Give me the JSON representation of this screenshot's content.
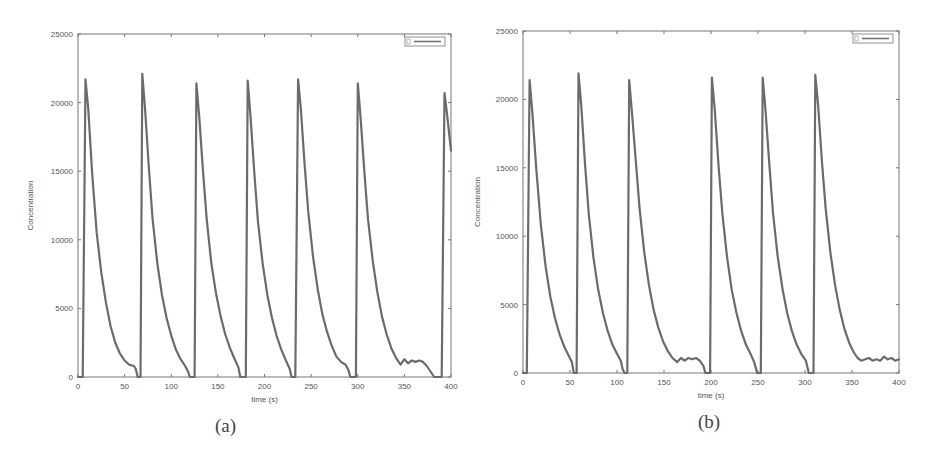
{
  "figure": {
    "panels": [
      {
        "caption": "(a)"
      },
      {
        "caption": "(b)"
      }
    ]
  },
  "chart_data": [
    {
      "type": "line",
      "title": "",
      "caption": "(a)",
      "xlabel": "time (s)",
      "ylabel": "Concentration",
      "xlim": [
        0,
        400
      ],
      "ylim": [
        0,
        25000
      ],
      "xticks": [
        0,
        50,
        100,
        150,
        200,
        250,
        300,
        350,
        400
      ],
      "yticks": [
        0,
        5000,
        10000,
        15000,
        20000,
        25000
      ],
      "grid": false,
      "legend": {
        "position": "upper right",
        "entries": [
          ""
        ]
      },
      "line_color": "#6b6b6b",
      "series": [
        {
          "name": "",
          "x": [
            0,
            5,
            8,
            11,
            15,
            20,
            25,
            30,
            35,
            40,
            45,
            50,
            55,
            60,
            62,
            64,
            65,
            67,
            69,
            72,
            76,
            80,
            85,
            90,
            95,
            100,
            105,
            110,
            115,
            118,
            120,
            121,
            122,
            124,
            125,
            127,
            130,
            134,
            138,
            143,
            148,
            153,
            158,
            163,
            168,
            172,
            174,
            175,
            177,
            179,
            180,
            182,
            185,
            189,
            193,
            198,
            203,
            208,
            213,
            218,
            223,
            227,
            229,
            230,
            232,
            233,
            236,
            239,
            243,
            247,
            252,
            257,
            262,
            267,
            272,
            277,
            282,
            287,
            290,
            292,
            293,
            296,
            298,
            300,
            303,
            307,
            311,
            316,
            321,
            326,
            331,
            336,
            341,
            346,
            350,
            354,
            358,
            362,
            366,
            370,
            374,
            378,
            382,
            385,
            386,
            388,
            390,
            393,
            396,
            400
          ],
          "y": [
            0,
            0,
            21700,
            19500,
            15000,
            10500,
            7600,
            5400,
            3700,
            2500,
            1700,
            1200,
            900,
            800,
            600,
            0,
            0,
            0,
            22100,
            19500,
            15200,
            11500,
            8300,
            6000,
            4300,
            3000,
            2000,
            1300,
            800,
            400,
            0,
            0,
            0,
            0,
            0,
            21400,
            19000,
            15000,
            11500,
            8300,
            6100,
            4400,
            3100,
            2100,
            1300,
            700,
            0,
            0,
            0,
            0,
            0,
            21600,
            19000,
            15000,
            11300,
            8300,
            6000,
            4300,
            3000,
            2000,
            1200,
            600,
            0,
            0,
            0,
            0,
            21700,
            19500,
            15500,
            12000,
            8800,
            6400,
            4600,
            3300,
            2300,
            1500,
            1100,
            900,
            500,
            0,
            0,
            0,
            0,
            21400,
            19000,
            15000,
            11500,
            8500,
            6200,
            4400,
            3100,
            2100,
            1400,
            900,
            1300,
            1000,
            1200,
            1100,
            1200,
            1100,
            800,
            400,
            0,
            0,
            0,
            0,
            0,
            20700,
            19000,
            16500
          ]
        }
      ]
    },
    {
      "type": "line",
      "title": "",
      "caption": "(b)",
      "xlabel": "time (s)",
      "ylabel": "Concentration",
      "xlim": [
        0,
        400
      ],
      "ylim": [
        0,
        25000
      ],
      "xticks": [
        0,
        50,
        100,
        150,
        200,
        250,
        300,
        350,
        400
      ],
      "yticks": [
        0,
        5000,
        10000,
        15000,
        20000,
        25000
      ],
      "grid": false,
      "legend": {
        "position": "upper right",
        "entries": [
          ""
        ]
      },
      "line_color": "#6b6b6b",
      "series": [
        {
          "name": "",
          "x": [
            0,
            4,
            7,
            10,
            14,
            19,
            24,
            29,
            34,
            39,
            44,
            49,
            52,
            54,
            55,
            57,
            59,
            62,
            66,
            70,
            75,
            80,
            85,
            90,
            95,
            100,
            104,
            106,
            108,
            109,
            111,
            113,
            116,
            120,
            124,
            129,
            134,
            139,
            144,
            149,
            154,
            159,
            164,
            168,
            172,
            176,
            180,
            184,
            188,
            192,
            194,
            195,
            197,
            199,
            201,
            204,
            208,
            212,
            217,
            222,
            227,
            232,
            237,
            242,
            246,
            248,
            249,
            251,
            253,
            255,
            258,
            262,
            266,
            271,
            276,
            281,
            286,
            291,
            296,
            301,
            303,
            304,
            307,
            309,
            311,
            314,
            318,
            322,
            327,
            332,
            337,
            342,
            347,
            352,
            356,
            360,
            364,
            368,
            372,
            376,
            380,
            384,
            388,
            392,
            396,
            400
          ],
          "y": [
            0,
            0,
            21400,
            19000,
            15000,
            10800,
            7800,
            5600,
            4000,
            2800,
            1900,
            1200,
            800,
            0,
            0,
            0,
            21900,
            19500,
            15300,
            11600,
            8400,
            6100,
            4400,
            3100,
            2100,
            1400,
            900,
            300,
            0,
            0,
            0,
            21400,
            19000,
            15500,
            12000,
            8800,
            6400,
            4600,
            3300,
            2300,
            1600,
            1100,
            800,
            1100,
            900,
            1100,
            1000,
            1100,
            900,
            500,
            0,
            0,
            0,
            0,
            21600,
            19200,
            15200,
            11700,
            8500,
            6100,
            4400,
            3100,
            2100,
            1400,
            800,
            300,
            0,
            0,
            0,
            21600,
            19200,
            15300,
            11700,
            8500,
            6200,
            4400,
            3100,
            2100,
            1400,
            900,
            300,
            0,
            0,
            0,
            21800,
            19500,
            15500,
            12000,
            8800,
            6400,
            4600,
            3200,
            2200,
            1500,
            1100,
            900,
            1000,
            1100,
            900,
            1000,
            900,
            1200,
            1000,
            1100,
            900,
            1000
          ]
        }
      ]
    }
  ]
}
